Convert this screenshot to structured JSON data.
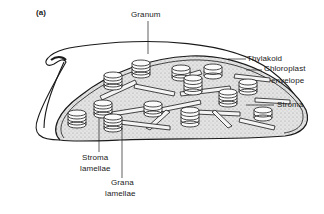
{
  "figure": {
    "panel_label": "(a)",
    "colors": {
      "ink": "#1a1a1a",
      "stroma_fill": "#dcdcdc",
      "background": "#ffffff"
    }
  },
  "labels": {
    "granum": "Granum",
    "thylakoid": "Thylakoid",
    "chloroplast_envelope_line1": "Chloroplast",
    "chloroplast_envelope_line2": "envelope",
    "stroma": "Stroma",
    "stroma_lamellae_line1": "Stroma",
    "stroma_lamellae_line2": "lamellae",
    "grana_lamellae_line1": "Grana",
    "grana_lamellae_line2": "lamellae"
  }
}
